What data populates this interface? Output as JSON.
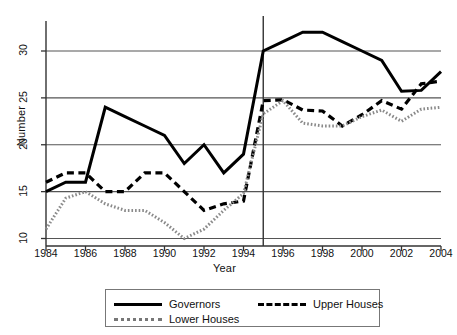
{
  "chart_data": {
    "type": "line",
    "title": "",
    "xlabel": "Year",
    "ylabel": "Number",
    "xlim": [
      1984,
      2004
    ],
    "ylim": [
      9.2,
      33.2
    ],
    "grid": true,
    "legend_position": "bottom",
    "xticks": [
      "1984",
      "1986",
      "1988",
      "1990",
      "1992",
      "1994",
      "1996",
      "1998",
      "2000",
      "2002",
      "2004"
    ],
    "yticks": [
      "10",
      "15",
      "20",
      "25",
      "30"
    ],
    "x": [
      1984,
      1985,
      1986,
      1987,
      1988,
      1989,
      1990,
      1991,
      1992,
      1993,
      1994,
      1995,
      1996,
      1997,
      1998,
      1999,
      2000,
      2001,
      2002,
      2003,
      2004
    ],
    "annotations": [
      {
        "name": "reference-line-1995",
        "type": "vline",
        "x": 1995
      }
    ],
    "series": [
      {
        "name": "Governors",
        "style": "solid",
        "color": "#000000",
        "values": [
          15,
          16,
          16,
          24,
          23,
          22,
          21,
          18,
          20,
          17,
          19,
          30,
          31,
          32,
          32,
          31,
          30,
          29,
          25.7,
          25.8,
          27.8
        ]
      },
      {
        "name": "Upper Houses",
        "style": "dashed",
        "color": "#000000",
        "values": [
          16,
          17,
          17,
          15,
          15,
          17,
          17,
          15,
          13,
          13.7,
          14,
          24.7,
          24.8,
          23.7,
          23.6,
          22,
          23.2,
          24.7,
          23.8,
          26.5,
          26.8
        ]
      },
      {
        "name": "Lower Houses",
        "style": "dotted",
        "color": "#8a8a8a",
        "values": [
          11,
          14.3,
          15,
          13.7,
          13,
          13,
          11.7,
          10,
          11,
          13,
          14.8,
          23.3,
          24.7,
          22.3,
          22,
          22,
          23,
          23.7,
          22.5,
          23.8,
          24
        ]
      }
    ]
  },
  "legend": {
    "entries": [
      {
        "label": "Governors",
        "swatch": "solid-line-swatch"
      },
      {
        "label": "Upper Houses",
        "swatch": "dashed-line-swatch"
      },
      {
        "label": "Lower Houses",
        "swatch": "dotted-line-swatch"
      }
    ]
  }
}
